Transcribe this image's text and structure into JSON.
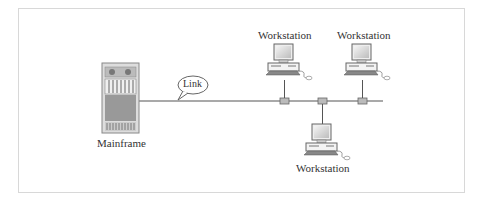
{
  "diagram": {
    "type": "network-topology",
    "nodes": {
      "mainframe": {
        "label": "Mainframe"
      },
      "ws_top_left": {
        "label": "Workstation"
      },
      "ws_top_right": {
        "label": "Workstation"
      },
      "ws_bottom": {
        "label": "Workstation"
      }
    },
    "link_callout": {
      "label": "Link"
    },
    "edges": [
      {
        "from": "mainframe",
        "to": "bus"
      },
      {
        "from": "bus",
        "to": "ws_top_left"
      },
      {
        "from": "bus",
        "to": "ws_top_right"
      },
      {
        "from": "bus",
        "to": "ws_bottom"
      }
    ]
  }
}
